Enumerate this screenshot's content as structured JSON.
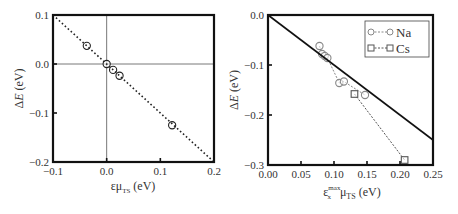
{
  "chart_data": [
    {
      "type": "scatter",
      "panel": "left",
      "xlabel": "εμ_TS (eV)",
      "xlabel_main": "εμ",
      "xlabel_sub": "TS",
      "xlabel_unit": "(eV)",
      "ylabel": "ΔE (eV)",
      "ylabel_delta": "Δ",
      "ylabel_var": "E",
      "ylabel_unit": "(eV)",
      "xlim": [
        -0.1,
        0.2
      ],
      "ylim": [
        -0.2,
        0.1
      ],
      "xticks": [
        "−0.1",
        "0.0",
        "0.1",
        "0.2"
      ],
      "yticks": [
        "0.1",
        "0.0",
        "−0.1",
        "−0.2"
      ],
      "grid": false,
      "zero_lines": true,
      "series": [
        {
          "name": "data",
          "marker": "open-circle",
          "x": [
            -0.037,
            0.0,
            0.012,
            0.024,
            0.122
          ],
          "y": [
            0.037,
            0.0,
            -0.012,
            -0.024,
            -0.125
          ]
        },
        {
          "name": "y = -x",
          "style": "dotted",
          "x": [
            -0.1,
            0.2
          ],
          "y": [
            0.1,
            -0.2
          ]
        }
      ]
    },
    {
      "type": "line",
      "panel": "right",
      "xlabel": "ε_x^max μ_TS (eV)",
      "xlabel_main": "ε",
      "xlabel_sub": "x",
      "xlabel_sup": "max",
      "xlabel_mu": "μ",
      "xlabel_mu_sub": "TS",
      "xlabel_unit": "(eV)",
      "ylabel": "ΔE (eV)",
      "ylabel_delta": "Δ",
      "ylabel_var": "E",
      "ylabel_unit": "(eV)",
      "xlim": [
        0.0,
        0.25
      ],
      "ylim": [
        -0.3,
        0.0
      ],
      "xticks": [
        "0.00",
        "0.05",
        "0.10",
        "0.15",
        "0.20",
        "0.25"
      ],
      "yticks": [
        "0.0",
        "−0.1",
        "−0.2",
        "−0.3"
      ],
      "grid": false,
      "legend_position": "upper right",
      "series": [
        {
          "name": "Na",
          "marker": "open-circle",
          "style": "dashed",
          "color": "#888888",
          "x": [
            0.078,
            0.082,
            0.086,
            0.09,
            0.108,
            0.115,
            0.147
          ],
          "y": [
            -0.062,
            -0.078,
            -0.082,
            -0.086,
            -0.136,
            -0.133,
            -0.16
          ]
        },
        {
          "name": "Cs",
          "marker": "open-square",
          "style": "dashed",
          "color": "#555555",
          "x": [
            0.131,
            0.207
          ],
          "y": [
            -0.158,
            -0.29
          ]
        },
        {
          "name": "y = -x",
          "style": "solid",
          "x": [
            0.0,
            0.25
          ],
          "y": [
            0.0,
            -0.25
          ]
        }
      ]
    }
  ]
}
